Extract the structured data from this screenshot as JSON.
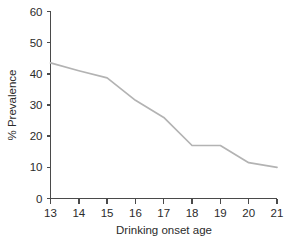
{
  "chart_data": {
    "type": "line",
    "title": "",
    "subtitle": "",
    "xlabel": "Drinking onset age",
    "ylabel": "% Prevalence",
    "x": [
      13,
      14,
      15,
      16,
      17,
      18,
      19,
      20,
      21
    ],
    "values": [
      43.5,
      41.0,
      38.7,
      31.5,
      26.0,
      17.0,
      17.0,
      11.5,
      10.0
    ],
    "series": [
      {
        "name": "Prevalence",
        "values": [
          43.5,
          41.0,
          38.7,
          31.5,
          26.0,
          17.0,
          17.0,
          11.5,
          10.0
        ]
      }
    ],
    "xticklabels": [
      "13",
      "14",
      "15",
      "16",
      "17",
      "18",
      "19",
      "20",
      "21"
    ],
    "yticklabels": [
      "0",
      "10",
      "20",
      "30",
      "40",
      "50",
      "60"
    ],
    "yticks": [
      0,
      10,
      20,
      30,
      40,
      50,
      60
    ],
    "xlim": [
      13,
      21
    ],
    "ylim": [
      0,
      60
    ],
    "grid": false,
    "legend": false,
    "legend_position": "none",
    "line_color": "#b3b3b3",
    "axis_color": "#4a4a4a",
    "text_color": "#2b2b2b",
    "background_color": "#ffffff"
  }
}
